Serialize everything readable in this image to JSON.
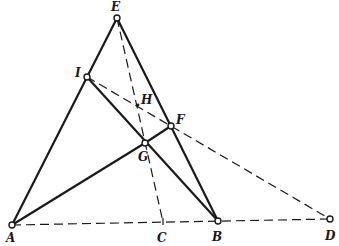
{
  "diagram": {
    "type": "geometry-construction",
    "points": [
      {
        "id": "A",
        "label": "A",
        "x": 12,
        "y": 225,
        "marker": "circle",
        "lx": 6,
        "ly": 242
      },
      {
        "id": "B",
        "label": "B",
        "x": 218,
        "y": 221,
        "marker": "circle",
        "lx": 212,
        "ly": 241
      },
      {
        "id": "C",
        "label": "C",
        "x": 163,
        "y": 222,
        "marker": "tick",
        "lx": 157,
        "ly": 242
      },
      {
        "id": "D",
        "label": "D",
        "x": 330,
        "y": 219,
        "marker": "circle",
        "lx": 325,
        "ly": 240
      },
      {
        "id": "E",
        "label": "E",
        "x": 117,
        "y": 18,
        "marker": "circle",
        "lx": 111,
        "ly": 11
      },
      {
        "id": "F",
        "label": "F",
        "x": 171,
        "y": 126,
        "marker": "circle",
        "lx": 176,
        "ly": 124
      },
      {
        "id": "G",
        "label": "G",
        "x": 145,
        "y": 143,
        "marker": "circle",
        "lx": 138,
        "ly": 161
      },
      {
        "id": "H",
        "label": "H",
        "x": 138,
        "y": 105,
        "marker": "cross",
        "lx": 141,
        "ly": 104
      },
      {
        "id": "I",
        "label": "I",
        "x": 87,
        "y": 77,
        "marker": "circle",
        "lx": 75,
        "ly": 77
      }
    ],
    "solid_segments": [
      {
        "from": "A",
        "to": "E"
      },
      {
        "from": "E",
        "to": "B"
      },
      {
        "from": "I",
        "to": "B"
      },
      {
        "from": "A",
        "to": "G"
      },
      {
        "from": "G",
        "to": "F"
      }
    ],
    "dashed_segments": [
      {
        "from": "A",
        "to": "D"
      },
      {
        "from": "I",
        "to": "D"
      },
      {
        "from": "E",
        "to": "C"
      }
    ]
  }
}
